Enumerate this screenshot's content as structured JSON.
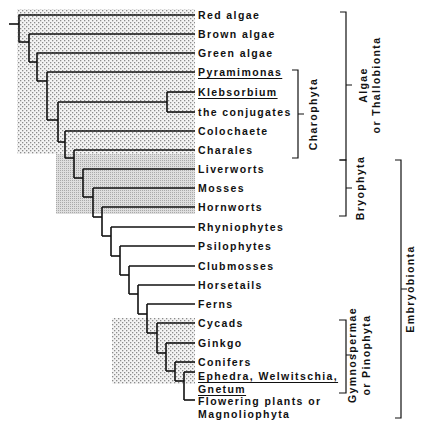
{
  "taxa": [
    {
      "name": "Red algae",
      "underline": false
    },
    {
      "name": "Brown algae",
      "underline": false
    },
    {
      "name": "Green algae",
      "underline": false
    },
    {
      "name": "Pyramimonas",
      "underline": true
    },
    {
      "name": "Klebsorbium",
      "underline": true
    },
    {
      "name": "the conjugates",
      "underline": false
    },
    {
      "name": "Colochaete",
      "underline": false
    },
    {
      "name": "Charales",
      "underline": false
    },
    {
      "name": "Liverworts",
      "underline": false
    },
    {
      "name": "Mosses",
      "underline": false
    },
    {
      "name": "Hornworts",
      "underline": false
    },
    {
      "name": "Rhyniophytes",
      "underline": false
    },
    {
      "name": "Psilophytes",
      "underline": false
    },
    {
      "name": "Clubmosses",
      "underline": false
    },
    {
      "name": "Horsetails",
      "underline": false
    },
    {
      "name": "Ferns",
      "underline": false
    },
    {
      "name": "Cycads",
      "underline": false
    },
    {
      "name": "Ginkgo",
      "underline": false
    },
    {
      "name": "Conifers",
      "underline": false
    },
    {
      "name": "Ephedra, Welwitschia,",
      "underline": true
    },
    {
      "name": "Gnetum",
      "underline": true
    },
    {
      "name": "Flowering plants or",
      "underline": false
    },
    {
      "name": "Magnoliophyta",
      "underline": false
    }
  ],
  "groups": {
    "charophyta": "Charophyta",
    "algae_line1": "Algae",
    "algae_line2": "or Thallobionta",
    "bryophyta": "Bryophyta",
    "gymno_line1": "Gymnospermae",
    "gymno_line2": "or Pinophyta",
    "embryobionta": "Embryobionta"
  },
  "colors": {
    "line": "#111111",
    "stipple_coarse": "#9a9a9a",
    "stipple_fine": "#c8c8c8"
  }
}
